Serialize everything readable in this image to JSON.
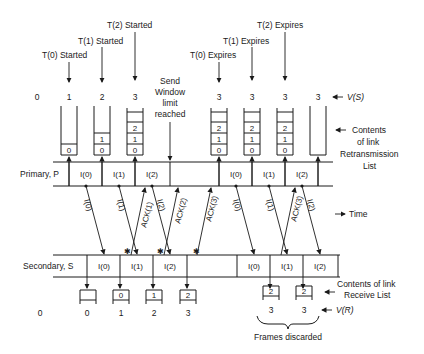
{
  "timers_started": [
    {
      "label": "T(0) Started",
      "x": 69,
      "y": 56
    },
    {
      "label": "T(1) Started",
      "x": 102,
      "y": 42
    },
    {
      "label": "T(2) Started",
      "x": 135,
      "y": 26
    }
  ],
  "timers_expires": [
    {
      "label": "T(0) Expires",
      "x": 219,
      "y": 56
    },
    {
      "label": "T(1) Expires",
      "x": 252,
      "y": 42
    },
    {
      "label": "T(2) Expires",
      "x": 285,
      "y": 26
    }
  ],
  "send_window_note": [
    "Send",
    "Window",
    "limit",
    "reached"
  ],
  "vs": {
    "label": "V(S)",
    "values": [
      "0",
      "1",
      "2",
      "3",
      "3",
      "3",
      "3",
      "3"
    ]
  },
  "retransmission_list": {
    "label": [
      "Contents",
      "of link",
      "Retransmission",
      "List"
    ],
    "stacks": [
      [
        "0"
      ],
      [
        "0",
        "1"
      ],
      [
        "0",
        "1",
        "2"
      ],
      [
        "0",
        "1",
        "2"
      ],
      [
        "0",
        "1",
        "2"
      ],
      [
        "0",
        "1",
        "2"
      ],
      []
    ]
  },
  "primary": {
    "label": "Primary, P",
    "frames": [
      "I(0)",
      "I(1)",
      "I(2)",
      "I(0)",
      "I(1)",
      "I(2)"
    ]
  },
  "secondary": {
    "label": "Secondary, S",
    "frames": [
      "I(0)",
      "I(1)",
      "I(2)",
      "I(0)",
      "I(1)",
      "I(2)"
    ]
  },
  "arrows_down": [
    "I(0)",
    "I(1)",
    "I(2)",
    "I(0)",
    "I(1)",
    "I(2)"
  ],
  "arrows_up": [
    "ACK(1)",
    "ACK(2)",
    "ACK(3)",
    "ACK(3)"
  ],
  "time_label": "Time",
  "receive_list": {
    "label": [
      "Contents of link",
      "Receive List"
    ],
    "boxes": [
      "",
      "0",
      "1",
      "2",
      "2",
      "2"
    ]
  },
  "vr": {
    "label": "V(R)",
    "values": [
      "0",
      "0",
      "1",
      "2",
      "3",
      "3",
      "3"
    ]
  },
  "frames_discarded": "Frames discarded"
}
